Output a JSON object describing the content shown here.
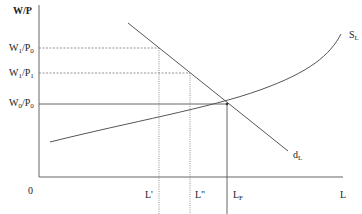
{
  "diagram": {
    "y_axis_label": "W/P",
    "x_axis_label": "L",
    "origin_label": "0",
    "y_levels": [
      {
        "id": "w1p0",
        "num": "W",
        "num_sub": "1",
        "den": "/P",
        "den_sub": "0"
      },
      {
        "id": "w1p1",
        "num": "W",
        "num_sub": "1",
        "den": "/P",
        "den_sub": "1"
      },
      {
        "id": "w0p0",
        "num": "W",
        "num_sub": "0",
        "den": "/P",
        "den_sub": "0"
      }
    ],
    "x_levels": [
      {
        "id": "l_prime",
        "label": "L'"
      },
      {
        "id": "l_double_prime",
        "label": "L\""
      },
      {
        "id": "l_f",
        "base": "L",
        "sub": "F"
      }
    ],
    "curves": {
      "supply": {
        "base": "S",
        "sub": "L"
      },
      "demand": {
        "base": "d",
        "sub": "L"
      }
    },
    "colors": {
      "axis": "#666666",
      "curve": "#555555",
      "guide": "#777777",
      "text": "#222222"
    }
  }
}
